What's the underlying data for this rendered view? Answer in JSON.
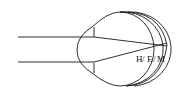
{
  "diagram": {
    "title": "",
    "labels": [
      {
        "id": "H",
        "text": "H"
      },
      {
        "id": "E",
        "text": "E"
      },
      {
        "id": "M",
        "text": "M"
      }
    ],
    "separator": "/",
    "colors": {
      "stroke": "#1a1a1a",
      "background": "#ffffff"
    }
  }
}
